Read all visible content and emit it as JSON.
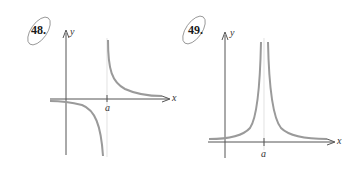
{
  "problems": [
    {
      "number": "48.",
      "y_label": "y",
      "x_label": "x",
      "asymptote_label": "a"
    },
    {
      "number": "49.",
      "y_label": "y",
      "x_label": "x",
      "asymptote_label": "a"
    }
  ],
  "colors": {
    "axis": "#555555",
    "curve": "#9a9a9a",
    "asymptote": "#d0d0d0",
    "circle": "#8a8a8a"
  }
}
